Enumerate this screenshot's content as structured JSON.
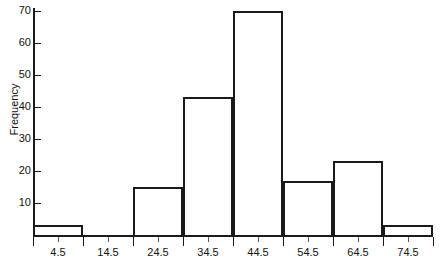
{
  "chart_data": {
    "type": "bar",
    "title": "",
    "subtitle": "",
    "xlabel": "",
    "ylabel": "Frequency",
    "categories": [
      "4.5",
      "14.5",
      "24.5",
      "34.5",
      "44.5",
      "54.5",
      "64.5",
      "74.5"
    ],
    "values": [
      3,
      0,
      15,
      43,
      70,
      17,
      23,
      3
    ],
    "bin_width": 10,
    "bin_edges": [
      "-0.5",
      "9.5",
      "19.5",
      "29.5",
      "39.5",
      "49.5",
      "59.5",
      "69.5",
      "79.5"
    ],
    "ylim": [
      0,
      72
    ],
    "xlim": [
      -0.5,
      79.5
    ],
    "yticks": [
      10,
      20,
      30,
      40,
      50,
      60,
      70
    ],
    "ytick_labels": [
      "10",
      "20",
      "30",
      "40",
      "50",
      "60",
      "70"
    ],
    "xtick_labels": [
      "4.5",
      "14.5",
      "24.5",
      "34.5",
      "44.5",
      "54.5",
      "64.5",
      "74.5"
    ],
    "grid": false,
    "legend": null,
    "legend_position": "none",
    "bar_style": "outline",
    "colors": {
      "axis": "#1a1a1a",
      "bar_edge": "#1a1a1a",
      "bar_fill": "#ffffff",
      "text": "#111111",
      "background": "#ffffff"
    }
  }
}
